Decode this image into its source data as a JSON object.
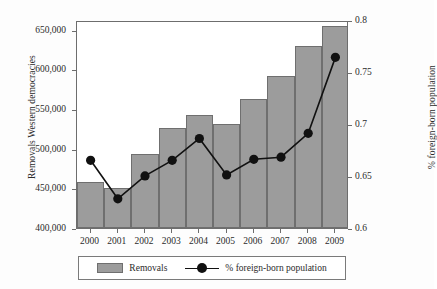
{
  "chart_data": {
    "type": "bar",
    "title": "",
    "subtitle": "",
    "xlabel": "",
    "ylabel": "Removals Western democracies",
    "y2label": "% foreign-born population",
    "categories": [
      "2000",
      "2001",
      "2002",
      "2003",
      "2004",
      "2005",
      "2006",
      "2007",
      "2008",
      "2009"
    ],
    "grid": false,
    "legend_position": "bottom",
    "ylim": [
      400000,
      662000
    ],
    "y_ticks": [
      400000,
      450000,
      500000,
      550000,
      600000,
      650000
    ],
    "y_tick_labels": [
      "400,000",
      "450,000",
      "500,000",
      "550,000",
      "600,000",
      "650,000"
    ],
    "y2lim": [
      0.6,
      0.8
    ],
    "y2_ticks": [
      0.6,
      0.65,
      0.7,
      0.75,
      0.8
    ],
    "y2_tick_labels": [
      "0.6",
      "0.65",
      "0.7",
      "0.75",
      "0.8"
    ],
    "series": [
      {
        "name": "Removals",
        "type": "bar",
        "axis": "left",
        "color": "#9c9c9c",
        "edge_color": "#6f6f6f",
        "values": [
          458000,
          450000,
          493000,
          526000,
          542000,
          531000,
          562000,
          592000,
          629000,
          655000
        ]
      },
      {
        "name": "% foreign-born population",
        "type": "line",
        "axis": "right",
        "color": "#111111",
        "marker": "circle",
        "values": [
          0.667,
          0.63,
          0.652,
          0.667,
          0.688,
          0.653,
          0.668,
          0.67,
          0.693,
          0.766
        ]
      }
    ]
  },
  "legend": {
    "items": [
      {
        "label": "Removals",
        "kind": "bar-swatch"
      },
      {
        "label": "% foreign-born population",
        "kind": "line-marker"
      }
    ]
  }
}
